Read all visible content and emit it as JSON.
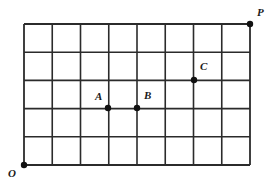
{
  "figure": {
    "canvas": {
      "width": 277,
      "height": 189,
      "background": "#ffffff"
    },
    "grid": {
      "x0": 24,
      "y0": 24,
      "x1": 250,
      "y1": 165,
      "columns": 8,
      "rows": 5,
      "cell_width": 28.25,
      "cell_height": 28.2,
      "line_color": "#2b2b2b",
      "line_width": 1.6,
      "border_width": 1.8
    },
    "points": [
      {
        "id": "O",
        "label": "O",
        "x": 24,
        "y": 165,
        "grid_col": 0,
        "grid_row": 0,
        "label_dx": -16,
        "label_dy": 3,
        "radius": 3.2
      },
      {
        "id": "A",
        "label": "A",
        "x": 108,
        "y": 108,
        "grid_col": 3,
        "grid_row": 2,
        "label_dx": -13,
        "label_dy": -17,
        "radius": 3.2
      },
      {
        "id": "B",
        "label": "B",
        "x": 137,
        "y": 108,
        "grid_col": 4,
        "grid_row": 2,
        "label_dx": 7,
        "label_dy": -18,
        "radius": 3.2
      },
      {
        "id": "C",
        "label": "C",
        "x": 194,
        "y": 80,
        "grid_col": 6,
        "grid_row": 3,
        "label_dx": 6,
        "label_dy": -19,
        "radius": 3.2
      },
      {
        "id": "P",
        "label": "P",
        "x": 250,
        "y": 24,
        "grid_col": 8,
        "grid_row": 5,
        "label_dx": 7,
        "label_dy": -17,
        "radius": 3.2
      }
    ],
    "point_color": "#111111"
  },
  "chart_data": {
    "type": "scatter",
    "title": "",
    "xlabel": "",
    "ylabel": "",
    "grid": true,
    "xlim": [
      0,
      8
    ],
    "ylim": [
      0,
      5
    ],
    "xticks": [
      0,
      1,
      2,
      3,
      4,
      5,
      6,
      7,
      8
    ],
    "yticks": [
      0,
      1,
      2,
      3,
      4,
      5
    ],
    "xtick_labels": [
      "",
      "",
      "",
      "",
      "",
      "",
      "",
      "",
      ""
    ],
    "ytick_labels": [
      "",
      "",
      "",
      "",
      "",
      ""
    ],
    "legend": null,
    "series": [
      {
        "name": "labeled points",
        "points": [
          {
            "label": "O",
            "x": 0,
            "y": 0
          },
          {
            "label": "A",
            "x": 3,
            "y": 2
          },
          {
            "label": "B",
            "x": 4,
            "y": 2
          },
          {
            "label": "C",
            "x": 6,
            "y": 3
          },
          {
            "label": "P",
            "x": 8,
            "y": 5
          }
        ]
      }
    ]
  }
}
